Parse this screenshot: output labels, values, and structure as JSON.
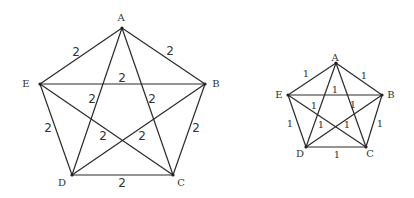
{
  "figures": [
    {
      "name": "large-complete-graph-k5",
      "vertices": [
        {
          "id": "A",
          "x": 122,
          "y": 28,
          "lx": 121,
          "ly": 21
        },
        {
          "id": "B",
          "x": 205,
          "y": 84,
          "lx": 216,
          "ly": 87
        },
        {
          "id": "C",
          "x": 173,
          "y": 175,
          "lx": 181,
          "ly": 186
        },
        {
          "id": "D",
          "x": 72,
          "y": 175,
          "lx": 62,
          "ly": 186
        },
        {
          "id": "E",
          "x": 40,
          "y": 84,
          "lx": 26,
          "ly": 87
        }
      ],
      "edges": [
        {
          "from": "A",
          "to": "B",
          "weight": "2",
          "lx": 170,
          "ly": 55
        },
        {
          "from": "A",
          "to": "E",
          "weight": "2",
          "lx": 76,
          "ly": 56
        },
        {
          "from": "E",
          "to": "B",
          "weight": "2",
          "lx": 122,
          "ly": 82
        },
        {
          "from": "A",
          "to": "D",
          "weight": "2",
          "lx": 92,
          "ly": 103
        },
        {
          "from": "A",
          "to": "C",
          "weight": "2",
          "lx": 152,
          "ly": 103
        },
        {
          "from": "E",
          "to": "D",
          "weight": "2",
          "lx": 48,
          "ly": 132
        },
        {
          "from": "B",
          "to": "C",
          "weight": "2",
          "lx": 196,
          "ly": 132
        },
        {
          "from": "E",
          "to": "C",
          "weight": "2",
          "lx": 103,
          "ly": 140
        },
        {
          "from": "B",
          "to": "D",
          "weight": "2",
          "lx": 142,
          "ly": 140
        },
        {
          "from": "D",
          "to": "C",
          "weight": "2",
          "lx": 122,
          "ly": 187
        }
      ]
    },
    {
      "name": "small-complete-graph-k5",
      "vertices": [
        {
          "id": "A",
          "x": 336,
          "y": 63,
          "lx": 335,
          "ly": 61
        },
        {
          "id": "B",
          "x": 382,
          "y": 95,
          "lx": 391,
          "ly": 98
        },
        {
          "id": "C",
          "x": 366,
          "y": 147,
          "lx": 370,
          "ly": 157
        },
        {
          "id": "D",
          "x": 306,
          "y": 147,
          "lx": 300,
          "ly": 157
        },
        {
          "id": "E",
          "x": 288,
          "y": 95,
          "lx": 279,
          "ly": 98
        }
      ],
      "edges": [
        {
          "from": "A",
          "to": "B",
          "weight": "1",
          "lx": 364,
          "ly": 79
        },
        {
          "from": "A",
          "to": "E",
          "weight": "1",
          "lx": 306,
          "ly": 77
        },
        {
          "from": "E",
          "to": "B",
          "weight": "1",
          "lx": 335,
          "ly": 93
        },
        {
          "from": "A",
          "to": "D",
          "weight": "1",
          "lx": 314,
          "ly": 109
        },
        {
          "from": "A",
          "to": "C",
          "weight": "1",
          "lx": 353,
          "ly": 108
        },
        {
          "from": "E",
          "to": "D",
          "weight": "1",
          "lx": 290,
          "ly": 127
        },
        {
          "from": "B",
          "to": "C",
          "weight": "1",
          "lx": 380,
          "ly": 127
        },
        {
          "from": "E",
          "to": "C",
          "weight": "1",
          "lx": 321,
          "ly": 128
        },
        {
          "from": "B",
          "to": "D",
          "weight": "1",
          "lx": 347,
          "ly": 128
        },
        {
          "from": "D",
          "to": "C",
          "weight": "1",
          "lx": 337,
          "ly": 158
        }
      ]
    }
  ]
}
